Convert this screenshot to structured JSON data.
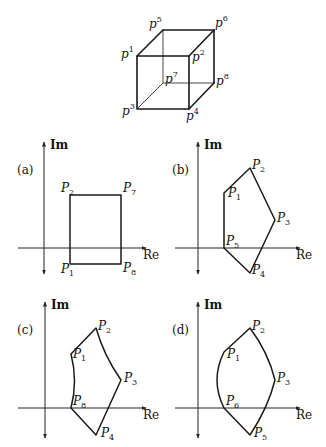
{
  "cube": {
    "vertices": {
      "p1": {
        "base": "p",
        "sup": "1",
        "x": 137,
        "y": 56
      },
      "p2": {
        "base": "p",
        "sup": "2",
        "x": 189,
        "y": 56
      },
      "p3": {
        "base": "p",
        "sup": "3",
        "x": 137,
        "y": 109
      },
      "p4": {
        "base": "p",
        "sup": "4",
        "x": 189,
        "y": 109
      },
      "p5": {
        "base": "p",
        "sup": "5",
        "x": 163,
        "y": 30
      },
      "p6": {
        "base": "p",
        "sup": "6",
        "x": 214,
        "y": 30
      },
      "p7": {
        "base": "p",
        "sup": "7",
        "x": 163,
        "y": 83
      },
      "p8": {
        "base": "p",
        "sup": "8",
        "x": 214,
        "y": 83
      }
    },
    "hidden_edges": [
      "p5-p7",
      "p7-p3",
      "p7-p8"
    ]
  },
  "axes": {
    "imag_label": "Im",
    "real_label": "Re"
  },
  "panels": [
    {
      "id": "a",
      "label": "(a)",
      "vertex_labels": [
        {
          "base": "P",
          "sub": "2"
        },
        {
          "base": "P",
          "sub": "7"
        },
        {
          "base": "P",
          "sub": "1"
        },
        {
          "base": "P",
          "sub": "8"
        }
      ]
    },
    {
      "id": "b",
      "label": "(b)",
      "vertex_labels": [
        {
          "base": "P",
          "sub": "2"
        },
        {
          "base": "P",
          "sub": "1"
        },
        {
          "base": "P",
          "sub": "3"
        },
        {
          "base": "P",
          "sub": "5"
        },
        {
          "base": "P",
          "sub": "4"
        }
      ]
    },
    {
      "id": "c",
      "label": "(c)",
      "vertex_labels": [
        {
          "base": "P",
          "sub": "2"
        },
        {
          "base": "P",
          "sub": "1"
        },
        {
          "base": "P",
          "sub": "3"
        },
        {
          "base": "P",
          "sub": "8"
        },
        {
          "base": "P",
          "sub": "4"
        }
      ]
    },
    {
      "id": "d",
      "label": "(d)",
      "vertex_labels": [
        {
          "base": "P",
          "sub": "2"
        },
        {
          "base": "P",
          "sub": "1"
        },
        {
          "base": "P",
          "sub": "3"
        },
        {
          "base": "P",
          "sub": "6"
        },
        {
          "base": "P",
          "sub": "5"
        }
      ]
    }
  ]
}
